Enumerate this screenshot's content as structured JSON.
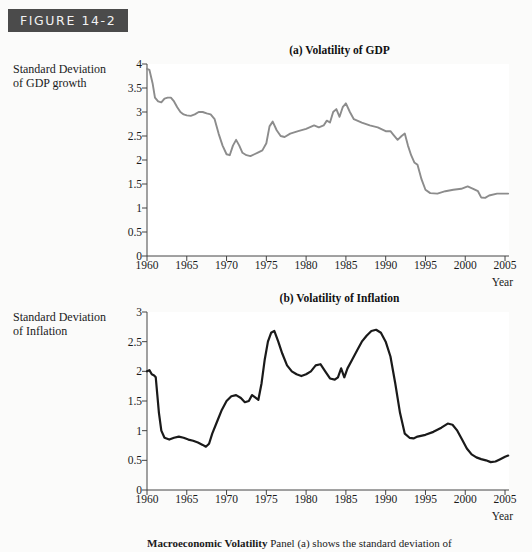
{
  "figure": {
    "tag": "FIGURE 14-2",
    "caption_bold": "Macroeconomic Volatility",
    "caption_text": "Panel (a) shows the standard deviation of"
  },
  "panel_a": {
    "title": "(a) Volatility of GDP",
    "axis_caption_line1": "Standard Deviation",
    "axis_caption_line2": "of GDP growth",
    "x_axis_name": "Year"
  },
  "panel_b": {
    "title": "(b) Volatility of Inflation",
    "axis_caption_line1": "Standard Deviation",
    "axis_caption_line2": "of Inflation",
    "x_axis_name": "Year"
  },
  "chart_data": [
    {
      "type": "line",
      "title": "(a) Volatility of GDP",
      "xlabel": "Year",
      "ylabel": "Standard Deviation of GDP growth",
      "xlim": [
        1960,
        2005.5
      ],
      "ylim": [
        0,
        4
      ],
      "xticks": [
        1960,
        1965,
        1970,
        1975,
        1980,
        1985,
        1990,
        1995,
        2000,
        2005
      ],
      "yticks": [
        0,
        0.5,
        1,
        1.5,
        2,
        2.5,
        3,
        3.5,
        4
      ],
      "ytick_labels": [
        "0",
        "0.5",
        "1",
        "1.5",
        "2",
        "2.5",
        "3",
        "3.5",
        "4"
      ],
      "grid": false,
      "legend": "none",
      "line_color": "#8c8c8c",
      "series": [
        {
          "name": "Standard deviation of GDP growth",
          "x": [
            1960.0,
            1960.3,
            1960.7,
            1961.0,
            1961.4,
            1961.8,
            1962.2,
            1962.6,
            1963.0,
            1963.4,
            1963.8,
            1964.2,
            1964.6,
            1965.0,
            1965.5,
            1966.0,
            1966.5,
            1967.0,
            1967.5,
            1968.0,
            1968.5,
            1969.0,
            1969.5,
            1970.0,
            1970.4,
            1970.8,
            1971.2,
            1971.6,
            1972.0,
            1972.5,
            1973.0,
            1973.5,
            1974.0,
            1974.5,
            1975.0,
            1975.4,
            1975.8,
            1976.3,
            1976.8,
            1977.3,
            1978.0,
            1979.0,
            1980.0,
            1981.0,
            1981.6,
            1982.2,
            1982.6,
            1983.0,
            1983.4,
            1983.8,
            1984.2,
            1984.6,
            1985.0,
            1985.5,
            1986.0,
            1987.0,
            1988.0,
            1989.0,
            1990.0,
            1990.6,
            1991.0,
            1991.5,
            1992.0,
            1992.4,
            1992.8,
            1993.2,
            1993.6,
            1994.0,
            1994.5,
            1995.0,
            1995.6,
            1996.5,
            1997.5,
            1998.5,
            1999.5,
            2000.3,
            2001.0,
            2001.6,
            2002.0,
            2002.5,
            2003.0,
            2004.0,
            2005.0,
            2005.4
          ],
          "y": [
            3.9,
            3.88,
            3.6,
            3.3,
            3.22,
            3.2,
            3.28,
            3.3,
            3.3,
            3.22,
            3.1,
            3.0,
            2.95,
            2.93,
            2.92,
            2.95,
            3.0,
            3.0,
            2.97,
            2.95,
            2.85,
            2.55,
            2.3,
            2.12,
            2.1,
            2.3,
            2.42,
            2.3,
            2.15,
            2.1,
            2.08,
            2.12,
            2.16,
            2.2,
            2.35,
            2.7,
            2.8,
            2.62,
            2.5,
            2.48,
            2.55,
            2.6,
            2.65,
            2.72,
            2.68,
            2.72,
            2.82,
            2.78,
            3.0,
            3.06,
            2.9,
            3.1,
            3.18,
            3.0,
            2.85,
            2.78,
            2.72,
            2.68,
            2.6,
            2.6,
            2.52,
            2.42,
            2.5,
            2.55,
            2.3,
            2.1,
            1.95,
            1.9,
            1.6,
            1.38,
            1.31,
            1.3,
            1.35,
            1.38,
            1.4,
            1.45,
            1.4,
            1.35,
            1.22,
            1.21,
            1.26,
            1.3,
            1.3,
            1.3
          ]
        }
      ]
    },
    {
      "type": "line",
      "title": "(b) Volatility of Inflation",
      "xlabel": "Year",
      "ylabel": "Standard Deviation of Inflation",
      "xlim": [
        1960,
        2005.5
      ],
      "ylim": [
        0,
        3
      ],
      "xticks": [
        1960,
        1965,
        1970,
        1975,
        1980,
        1985,
        1990,
        1995,
        2000,
        2005
      ],
      "yticks": [
        0,
        0.5,
        1,
        1.5,
        2,
        2.5,
        3
      ],
      "ytick_labels": [
        "0",
        "0.5",
        "1",
        "1.5",
        "2",
        "2.5",
        "3"
      ],
      "grid": false,
      "legend": "none",
      "line_color": "#1a1a1a",
      "series": [
        {
          "name": "Standard deviation of inflation",
          "x": [
            1960.0,
            1960.3,
            1960.6,
            1960.9,
            1961.1,
            1961.3,
            1961.5,
            1961.8,
            1962.2,
            1962.8,
            1963.4,
            1964.0,
            1964.6,
            1965.2,
            1965.8,
            1966.4,
            1967.0,
            1967.4,
            1967.8,
            1968.2,
            1968.8,
            1969.4,
            1970.0,
            1970.6,
            1971.2,
            1971.8,
            1972.3,
            1972.8,
            1973.2,
            1973.6,
            1974.0,
            1974.4,
            1974.8,
            1975.2,
            1975.6,
            1976.0,
            1976.5,
            1977.0,
            1977.6,
            1978.2,
            1978.8,
            1979.4,
            1980.0,
            1980.6,
            1981.2,
            1981.8,
            1982.4,
            1983.0,
            1983.6,
            1984.0,
            1984.4,
            1984.8,
            1985.2,
            1985.8,
            1986.4,
            1987.0,
            1987.6,
            1988.2,
            1988.8,
            1989.4,
            1990.0,
            1990.6,
            1991.2,
            1991.8,
            1992.4,
            1993.0,
            1993.5,
            1994.0,
            1995.0,
            1996.0,
            1997.0,
            1997.8,
            1998.4,
            1999.0,
            1999.6,
            2000.2,
            2000.8,
            2001.4,
            2002.0,
            2002.6,
            2003.2,
            2003.8,
            2004.4,
            2005.0,
            2005.4
          ],
          "y": [
            2.0,
            2.02,
            1.95,
            1.93,
            1.9,
            1.6,
            1.3,
            1.0,
            0.88,
            0.85,
            0.88,
            0.9,
            0.88,
            0.85,
            0.83,
            0.8,
            0.76,
            0.73,
            0.78,
            0.95,
            1.15,
            1.35,
            1.5,
            1.58,
            1.6,
            1.55,
            1.48,
            1.5,
            1.6,
            1.56,
            1.52,
            1.8,
            2.2,
            2.5,
            2.65,
            2.68,
            2.5,
            2.3,
            2.1,
            2.0,
            1.95,
            1.92,
            1.95,
            2.0,
            2.1,
            2.12,
            2.0,
            1.88,
            1.86,
            1.9,
            2.05,
            1.9,
            2.05,
            2.2,
            2.35,
            2.5,
            2.6,
            2.68,
            2.7,
            2.65,
            2.5,
            2.25,
            1.8,
            1.3,
            0.95,
            0.88,
            0.87,
            0.9,
            0.93,
            0.98,
            1.05,
            1.12,
            1.1,
            1.0,
            0.85,
            0.7,
            0.6,
            0.55,
            0.52,
            0.5,
            0.47,
            0.48,
            0.52,
            0.56,
            0.58
          ]
        }
      ]
    }
  ]
}
